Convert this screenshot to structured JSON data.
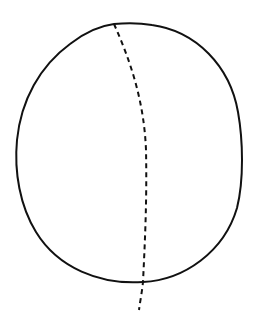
{
  "diagram": {
    "type": "line-drawing",
    "colors": {
      "background": "#ffffff",
      "stroke": "#111111"
    },
    "shapes": [
      {
        "name": "rounded-outline",
        "style": "solid",
        "bounds": {
          "left": 16,
          "top": 24,
          "right": 242,
          "bottom": 283
        }
      },
      {
        "name": "dashed-midline",
        "style": "dashed",
        "start": [
          114,
          24
        ],
        "end": [
          139,
          310
        ]
      }
    ],
    "labels": []
  }
}
